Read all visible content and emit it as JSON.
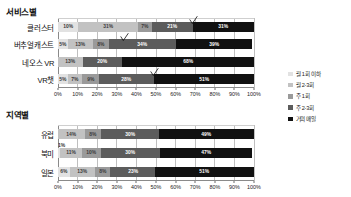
{
  "legend": {
    "position": "right",
    "items": [
      {
        "label": "월 1회 이하",
        "color": "#e2e2e2"
      },
      {
        "label": "월 2-3회",
        "color": "#c2c2c2"
      },
      {
        "label": "주 1회",
        "color": "#9a9a9a"
      },
      {
        "label": "주 2-3회",
        "color": "#5c5c5c"
      },
      {
        "label": "거의 매일",
        "color": "#111111"
      }
    ]
  },
  "sections": [
    {
      "title": "서비스별",
      "axis_ticks": [
        "0%",
        "10%",
        "20%",
        "30%",
        "40%",
        "50%",
        "60%",
        "70%",
        "80%",
        "90%",
        "100%"
      ]
    },
    {
      "title": "지역별",
      "axis_ticks": [
        "0%",
        "10%",
        "20%",
        "30%",
        "40%",
        "50%",
        "60%",
        "70%",
        "80%",
        "90%",
        "100%"
      ]
    }
  ],
  "chart_data": [
    {
      "type": "bar",
      "orientation": "horizontal",
      "stacked": true,
      "normalized": true,
      "title": "서비스별",
      "xlabel": "",
      "ylabel": "",
      "xlim": [
        0,
        100
      ],
      "grid": true,
      "legend_position": "right",
      "categories": [
        "클러스터",
        "버추얼캐스트",
        "네오스 VR",
        "VR챗"
      ],
      "series": [
        {
          "name": "월 1회 이하",
          "color": "#e2e2e2",
          "values": [
            10,
            5,
            0,
            5
          ]
        },
        {
          "name": "월 2-3회",
          "color": "#c2c2c2",
          "values": [
            31,
            13,
            13,
            7
          ]
        },
        {
          "name": "주 1회",
          "color": "#9a9a9a",
          "values": [
            7,
            8,
            0,
            9
          ]
        },
        {
          "name": "주 2-3회",
          "color": "#5c5c5c",
          "values": [
            21,
            34,
            20,
            28
          ]
        },
        {
          "name": "거의 매일",
          "color": "#111111",
          "values": [
            31,
            39,
            68,
            51
          ]
        }
      ],
      "data_labels": [
        [
          "10%",
          "31%",
          "7%",
          "21%",
          "31%"
        ],
        [
          "5%",
          "13%",
          "8%",
          "34%",
          "39%"
        ],
        [
          "",
          "13%",
          "",
          "20%",
          "68%"
        ],
        [
          "5%",
          "7%",
          "9%",
          "28%",
          "51%"
        ]
      ],
      "annotations": [
        {
          "type": "checkmark",
          "row": 0,
          "at_percent": 69
        },
        {
          "type": "checkmark",
          "row": 1,
          "at_percent": 34
        },
        {
          "type": "checkmark",
          "row": 3,
          "at_percent": 49
        }
      ]
    },
    {
      "type": "bar",
      "orientation": "horizontal",
      "stacked": true,
      "normalized": true,
      "title": "지역별",
      "xlabel": "",
      "ylabel": "",
      "xlim": [
        0,
        100
      ],
      "grid": true,
      "legend_position": "right",
      "categories": [
        "유럽",
        "북미",
        "일본"
      ],
      "series": [
        {
          "name": "월 1회 이하",
          "color": "#e2e2e2",
          "values": [
            0,
            1,
            6
          ]
        },
        {
          "name": "월 2-3회",
          "color": "#c2c2c2",
          "values": [
            14,
            11,
            13
          ]
        },
        {
          "name": "주 1회",
          "color": "#9a9a9a",
          "values": [
            8,
            10,
            8
          ]
        },
        {
          "name": "주 2-3회",
          "color": "#5c5c5c",
          "values": [
            30,
            30,
            23
          ]
        },
        {
          "name": "거의 매일",
          "color": "#111111",
          "values": [
            49,
            47,
            51
          ]
        }
      ],
      "data_labels": [
        [
          "",
          "14%",
          "8%",
          "30%",
          "49%"
        ],
        [
          "1%",
          "11%",
          "10%",
          "30%",
          "47%"
        ],
        [
          "6%",
          "13%",
          "8%",
          "23%",
          "51%"
        ]
      ],
      "outside_labels": [
        {
          "row": 1,
          "text": "1%"
        }
      ],
      "annotations": []
    }
  ]
}
